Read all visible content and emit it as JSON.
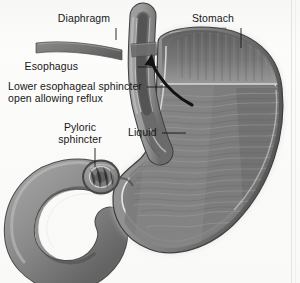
{
  "figure": {
    "style": "grayscale medical illustration",
    "background_color": "#fbfbfa",
    "ink_color": "#171717"
  },
  "labels": [
    {
      "id": "diaphragm",
      "text": "Diaphragm",
      "align": "center",
      "x": 84,
      "y": 14,
      "leader": {
        "type": "line",
        "x1": 116,
        "y1": 28,
        "x2": 116,
        "y2": 40
      }
    },
    {
      "id": "stomach",
      "text": "Stomach",
      "align": "center",
      "x": 213,
      "y": 14,
      "leader": {
        "type": "line",
        "x1": 241,
        "y1": 28,
        "x2": 241,
        "y2": 48
      }
    },
    {
      "id": "esophagus",
      "text": "Esophagus",
      "align": "right",
      "x": 80,
      "y": 62,
      "leader": {
        "type": "line",
        "x1": 138,
        "y1": 67,
        "x2": 158,
        "y2": 67
      }
    },
    {
      "id": "lower-esophageal-sphincter",
      "text": "Lower esophageal sphincter open allowing reflux",
      "line1": "Lower esophageal sphincter",
      "line2": "open allowing reflux",
      "align": "right",
      "x": 12,
      "y": 82,
      "leader": {
        "type": "line",
        "x1": 147,
        "y1": 87,
        "x2": 166,
        "y2": 87
      }
    },
    {
      "id": "pyloric-sphincter",
      "text": "Pyloric sphincter",
      "line1": "Pyloric",
      "line2": "sphincter",
      "align": "center",
      "x": 68,
      "y": 124,
      "leader": {
        "type": "line",
        "x1": 95,
        "y1": 148,
        "x2": 95,
        "y2": 167
      }
    },
    {
      "id": "liquid",
      "text": "Liquid",
      "align": "left",
      "x": 128,
      "y": 128,
      "leader": {
        "type": "line",
        "x1": 162,
        "y1": 133,
        "x2": 185,
        "y2": 133
      }
    }
  ],
  "annotations": [
    {
      "id": "reflux-arrow",
      "type": "curved-arrow",
      "description": "curved arrow showing reflux of liquid up from stomach body into the esophagus",
      "direction": "upward-left"
    }
  ],
  "anatomy": [
    {
      "id": "esophagus-tube",
      "name": "esophagus"
    },
    {
      "id": "diaphragm-left",
      "name": "diaphragm left crus"
    },
    {
      "id": "diaphragm-right",
      "name": "diaphragm right crus"
    },
    {
      "id": "stomach-body",
      "name": "stomach body"
    },
    {
      "id": "fundus-air",
      "name": "gastric air bubble in fundus"
    },
    {
      "id": "gastric-liquid",
      "name": "gastric liquid"
    },
    {
      "id": "rugae",
      "name": "gastric rugae"
    },
    {
      "id": "pylorus",
      "name": "pyloric sphincter ring"
    },
    {
      "id": "duodenum",
      "name": "duodenum"
    }
  ]
}
